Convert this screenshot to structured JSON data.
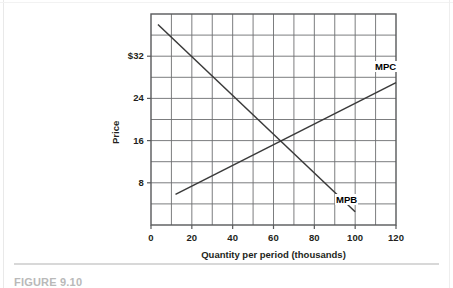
{
  "figure": {
    "caption": "FIGURE 9.10"
  },
  "chart_data": {
    "type": "line",
    "title": "",
    "xlabel": "Quantity per period (thousands)",
    "ylabel": "Price",
    "xlim": [
      0,
      120
    ],
    "ylim": [
      0,
      40
    ],
    "grid": true,
    "grid_x_step": 10,
    "grid_y_step": 4,
    "xticks": [
      0,
      20,
      40,
      60,
      80,
      100,
      120
    ],
    "xtick_labels": [
      "0",
      "20",
      "40",
      "60",
      "80",
      "100",
      "120"
    ],
    "yticks": [
      8,
      16,
      24,
      32
    ],
    "ytick_labels": [
      "8",
      "16",
      "24",
      "$32"
    ],
    "legend_position": "inline-end-labels",
    "equilibrium": {
      "quantity": 60,
      "price": 16
    },
    "series": [
      {
        "name": "MPB",
        "label": "MPB",
        "slope": -0.3667,
        "intercept": 38,
        "points": [
          {
            "x": 3.4,
            "y": 38.0
          },
          {
            "x": 60.0,
            "y": 16.0
          },
          {
            "x": 100.0,
            "y": 2.5
          }
        ]
      },
      {
        "name": "MPC",
        "label": "MPC",
        "slope": 0.1967,
        "intercept": 4.2,
        "points": [
          {
            "x": 12.0,
            "y": 5.8
          },
          {
            "x": 60.0,
            "y": 16.0
          },
          {
            "x": 120.0,
            "y": 27.0
          }
        ]
      }
    ]
  }
}
